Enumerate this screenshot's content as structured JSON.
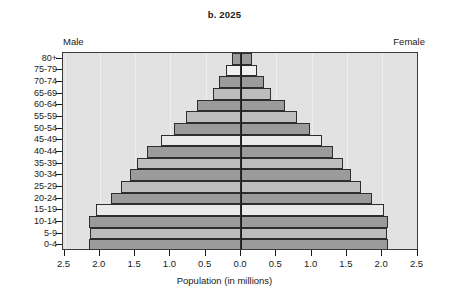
{
  "chart_data": {
    "type": "bar",
    "subtype": "population-pyramid",
    "title": "b. 2025",
    "xlabel": "Population (in millions)",
    "ylabel": "",
    "grid": true,
    "legend_position": "none",
    "left_header": "Male",
    "right_header": "Female",
    "xlim": [
      -2.5,
      2.5
    ],
    "xticks": [
      2.5,
      2.0,
      1.5,
      1.0,
      0.5,
      0.0,
      0.5,
      1.0,
      1.5,
      2.0,
      2.5
    ],
    "xtick_labels": [
      "2.5",
      "2.0",
      "1.5",
      "1.0",
      "0.5",
      "0.0",
      "0.5",
      "1.0",
      "1.5",
      "2.0",
      "2.5"
    ],
    "categories": [
      "80+",
      "75-79",
      "70-74",
      "65-69",
      "60-64",
      "55-59",
      "50-54",
      "45-49",
      "40-44",
      "35-39",
      "30-34",
      "25-29",
      "20-24",
      "15-19",
      "10-14",
      "5-9",
      "0-4"
    ],
    "series": [
      {
        "name": "Male",
        "side": "left",
        "values": [
          0.13,
          0.21,
          0.31,
          0.4,
          0.62,
          0.78,
          0.95,
          1.13,
          1.33,
          1.47,
          1.57,
          1.7,
          1.84,
          2.05,
          2.15,
          2.14,
          2.15
        ]
      },
      {
        "name": "Female",
        "side": "right",
        "values": [
          0.16,
          0.22,
          0.33,
          0.43,
          0.62,
          0.8,
          0.98,
          1.15,
          1.3,
          1.45,
          1.56,
          1.7,
          1.86,
          2.02,
          2.08,
          2.07,
          2.08
        ]
      }
    ],
    "bar_shades": [
      "#9b9b9b",
      "#f0f0f0",
      "#9b9b9b",
      "#bdbdbd",
      "#9b9b9b",
      "#bdbdbd",
      "#9b9b9b",
      "#eaeaea",
      "#9b9b9b",
      "#bdbdbd",
      "#9b9b9b",
      "#bdbdbd",
      "#9b9b9b",
      "#eaeaea",
      "#9b9b9b",
      "#bdbdbd",
      "#9b9b9b"
    ],
    "plot_background": "#e2e2e2",
    "axis_color": "#1a1a1a"
  }
}
